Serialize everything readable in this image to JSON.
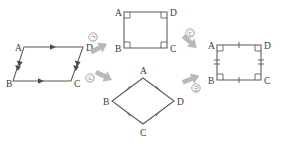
{
  "figure": {
    "type": "geometry-transformation-diagram",
    "background_color": "#ffffff",
    "stroke_color": "#58595b",
    "arrow_color": "#b9b9b9",
    "label_color": "#3a3a3a",
    "marker_color": "#8a8a8a"
  },
  "shapes": [
    {
      "id": "parallelogram",
      "name": "parallelogram-abcd",
      "vertices": [
        {
          "label": "A",
          "x": 24,
          "y": 47
        },
        {
          "label": "D",
          "x": 83,
          "y": 47
        },
        {
          "label": "C",
          "x": 71,
          "y": 81
        },
        {
          "label": "B",
          "x": 13,
          "y": 81
        }
      ],
      "label_positions": [
        {
          "label": "A",
          "x": 15,
          "y": 51
        },
        {
          "label": "D",
          "x": 86,
          "y": 51
        },
        {
          "label": "C",
          "x": 74,
          "y": 87
        },
        {
          "label": "B",
          "x": 6,
          "y": 87
        }
      ],
      "side_marks": "parallel-arrows",
      "marks_detail": "single arrowheads on AD and BC; double arrowheads on AB and DC"
    },
    {
      "id": "rectangle",
      "name": "rectangle-abcd",
      "vertices": [
        {
          "label": "A",
          "x": 124,
          "y": 12
        },
        {
          "label": "D",
          "x": 167,
          "y": 12
        },
        {
          "label": "C",
          "x": 167,
          "y": 48
        },
        {
          "label": "B",
          "x": 124,
          "y": 48
        }
      ],
      "label_positions": [
        {
          "label": "A",
          "x": 115,
          "y": 16
        },
        {
          "label": "D",
          "x": 170,
          "y": 16
        },
        {
          "label": "C",
          "x": 170,
          "y": 52
        },
        {
          "label": "B",
          "x": 115,
          "y": 52
        }
      ],
      "side_marks": "right-angle-squares",
      "marks_detail": "right angle squares at all four corners"
    },
    {
      "id": "rhombus",
      "name": "rhombus-abcd",
      "vertices": [
        {
          "label": "A",
          "x": 143,
          "y": 78
        },
        {
          "label": "D",
          "x": 174,
          "y": 101
        },
        {
          "label": "C",
          "x": 143,
          "y": 124
        },
        {
          "label": "B",
          "x": 112,
          "y": 101
        }
      ],
      "label_positions": [
        {
          "label": "A",
          "x": 140,
          "y": 74
        },
        {
          "label": "D",
          "x": 177,
          "y": 105
        },
        {
          "label": "C",
          "x": 140,
          "y": 136
        },
        {
          "label": "B",
          "x": 103,
          "y": 105
        }
      ],
      "side_marks": "equal-length-ticks",
      "marks_detail": "single tick mark on each of the four sides"
    },
    {
      "id": "square",
      "name": "square-abcd",
      "vertices": [
        {
          "label": "A",
          "x": 217,
          "y": 45
        },
        {
          "label": "D",
          "x": 261,
          "y": 45
        },
        {
          "label": "C",
          "x": 261,
          "y": 80
        },
        {
          "label": "B",
          "x": 217,
          "y": 80
        }
      ],
      "label_positions": [
        {
          "label": "A",
          "x": 208,
          "y": 49
        },
        {
          "label": "D",
          "x": 264,
          "y": 49
        },
        {
          "label": "C",
          "x": 264,
          "y": 84
        },
        {
          "label": "B",
          "x": 208,
          "y": 84
        }
      ],
      "side_marks": "right-angles-and-ticks",
      "marks_detail": "right angle squares at all corners, single ticks on top and bottom, double ticks on left and right"
    }
  ],
  "arrows": [
    {
      "id": "arrow-1",
      "name": "arrow-parallelogram-to-rectangle",
      "from": "parallelogram",
      "to": "rectangle",
      "marker": "㉠",
      "marker_x": 93,
      "marker_y": 37,
      "x": 99,
      "y": 48,
      "rotation": -28
    },
    {
      "id": "arrow-2",
      "name": "arrow-parallelogram-to-rhombus",
      "from": "parallelogram",
      "to": "rhombus",
      "marker": "㉡",
      "marker_x": 90,
      "marker_y": 76,
      "x": 98,
      "y": 74,
      "rotation": 26
    },
    {
      "id": "arrow-3",
      "name": "arrow-rectangle-to-square",
      "from": "rectangle",
      "to": "square",
      "marker": "㉢",
      "marker_x": 190,
      "marker_y": 35,
      "x": 190,
      "y": 42,
      "rotation": 40
    },
    {
      "id": "arrow-4",
      "name": "arrow-rhombus-to-square",
      "from": "rhombus",
      "to": "square",
      "marker": "㉣",
      "marker_x": 196,
      "marker_y": 86,
      "x": 191,
      "y": 79,
      "rotation": -22
    }
  ]
}
